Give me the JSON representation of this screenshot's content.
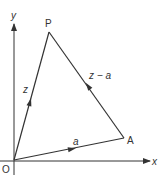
{
  "diagram": {
    "type": "vector-triangle",
    "colors": {
      "stroke": "#333333",
      "background": "#ffffff"
    },
    "axes": {
      "x_label": "x",
      "y_label": "y",
      "origin_label": "O"
    },
    "points": [
      {
        "name": "O",
        "label": "O"
      },
      {
        "name": "P",
        "label": "P"
      },
      {
        "name": "A",
        "label": "A"
      }
    ],
    "vectors": [
      {
        "from": "O",
        "to": "P",
        "label": "z"
      },
      {
        "from": "O",
        "to": "A",
        "label": "a"
      },
      {
        "from": "A",
        "to": "P",
        "label": "z − a"
      }
    ]
  }
}
